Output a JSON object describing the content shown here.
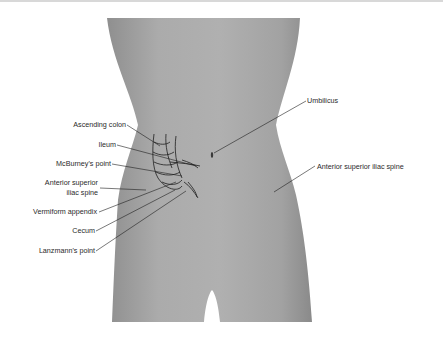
{
  "figure": {
    "colors": {
      "silhouette": "#a9a9a9",
      "silhouette_shade": "#8f8f8f",
      "line": "#1e1e1e",
      "background": "#ffffff"
    }
  },
  "labels": {
    "left": [
      {
        "id": "ascending-colon",
        "text": "Ascending colon"
      },
      {
        "id": "ileum",
        "text": "Ileum"
      },
      {
        "id": "mcburneys-point",
        "text": "McBurney's point"
      },
      {
        "id": "asis-right-line1",
        "text": "Anterior superior"
      },
      {
        "id": "asis-right-line2",
        "text": "iliac spine"
      },
      {
        "id": "vermiform-appendix",
        "text": "Vermiform appendix"
      },
      {
        "id": "cecum",
        "text": "Cecum"
      },
      {
        "id": "lanzmanns-point",
        "text": "Lanzmann's point"
      }
    ],
    "right": [
      {
        "id": "umbilicus",
        "text": "Umbilicus"
      },
      {
        "id": "asis-left",
        "text": "Anterior superior iliac spine"
      }
    ]
  }
}
